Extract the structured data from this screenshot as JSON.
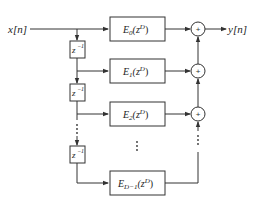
{
  "diagram": {
    "type": "polyphase-decomposition",
    "input_label": "x[n]",
    "output_label": "y[n]",
    "delay_label": "z",
    "delay_exp": "−1",
    "branches": [
      {
        "name": "E",
        "sub": "0",
        "arg_base": "(z",
        "arg_exp": "D",
        "arg_close": ")"
      },
      {
        "name": "E",
        "sub": "1",
        "arg_base": "(z",
        "arg_exp": "D",
        "arg_close": ")"
      },
      {
        "name": "E",
        "sub": "2",
        "arg_base": "(z",
        "arg_exp": "D",
        "arg_close": ")"
      },
      {
        "name": "E",
        "sub": "D−1",
        "arg_base": "(z",
        "arg_exp": "D",
        "arg_close": ")"
      }
    ],
    "adder_symbol": "+",
    "ellipsis": "⋮",
    "colors": {
      "line": "#333333",
      "text": "#222222",
      "background": "#ffffff"
    }
  }
}
